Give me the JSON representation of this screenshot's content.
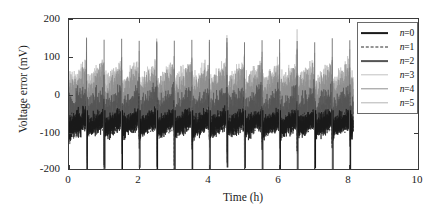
{
  "chart_data": {
    "type": "line",
    "title": "",
    "xlabel": "Time (h)",
    "ylabel": "Voltage error (mV)",
    "xlim": [
      0,
      10
    ],
    "ylim": [
      -200,
      200
    ],
    "xticks": [
      0,
      2,
      4,
      6,
      8,
      10
    ],
    "yticks": [
      200,
      100,
      0,
      -100,
      -200
    ],
    "grid": false,
    "legend_position": "upper right",
    "data_extent_hours": 8.1,
    "series": [
      {
        "name": "n=0",
        "label_prefix": "n",
        "label_value": "0",
        "color": "#1a1a1a",
        "dash": "solid",
        "band_low": -105,
        "band_high": -45,
        "spike_low": -200,
        "spike_high": 20,
        "description": "dark dense band near -75 mV with deep negative spikes to -200 mV"
      },
      {
        "name": "n=1",
        "label_prefix": "n",
        "label_value": "1",
        "color": "#2b2b2b",
        "dash": "dashed",
        "band_low": -100,
        "band_high": -50,
        "spike_low": -195,
        "spike_high": 15,
        "description": "dashed black trace overlapping the n=0 band"
      },
      {
        "name": "n=2",
        "label_prefix": "n",
        "label_value": "2",
        "color": "#555555",
        "dash": "solid",
        "band_low": -90,
        "band_high": 10,
        "spike_low": -180,
        "spike_high": 60,
        "description": "dark grey mid band"
      },
      {
        "name": "n=3",
        "label_prefix": "n",
        "label_value": "3",
        "color": "#c2c2c2",
        "dash": "solid",
        "band_low": -40,
        "band_high": 70,
        "spike_low": -150,
        "spike_high": 150,
        "description": "light grey broad band up to +70 mV with tall spikes to +150 mV"
      },
      {
        "name": "n=4",
        "label_prefix": "n",
        "label_value": "4",
        "color": "#8f8f8f",
        "dash": "solid",
        "band_low": -60,
        "band_high": 55,
        "spike_low": -165,
        "spike_high": 130,
        "description": "medium grey band"
      },
      {
        "name": "n=5",
        "label_prefix": "n",
        "label_value": "5",
        "color": "#b4b4b4",
        "dash": "solid",
        "band_low": -50,
        "band_high": 65,
        "spike_low": -160,
        "spike_high": 145,
        "description": "light grey band"
      }
    ],
    "spike_period_hours": 0.5,
    "spike_count": 16
  },
  "axes": {
    "x_tick_labels": [
      "0",
      "2",
      "4",
      "6",
      "8",
      "10"
    ],
    "y_tick_labels": [
      "200",
      "100",
      "0",
      "-100",
      "-200"
    ],
    "x_title": "Time (h)",
    "y_title": "Voltage error (mV)"
  },
  "legend": {
    "entries": [
      {
        "prefix": "n",
        "eq": "=",
        "value": "0",
        "text": "n=0"
      },
      {
        "prefix": "n",
        "eq": "=",
        "value": "1",
        "text": "n=1"
      },
      {
        "prefix": "n",
        "eq": "=",
        "value": "2",
        "text": "n=2"
      },
      {
        "prefix": "n",
        "eq": "=",
        "value": "3",
        "text": "n=3"
      },
      {
        "prefix": "n",
        "eq": "=",
        "value": "4",
        "text": "n=4"
      },
      {
        "prefix": "n",
        "eq": "=",
        "value": "5",
        "text": "n=5"
      }
    ]
  },
  "colors": {
    "axis": "#3a3a3a",
    "legend_border": "#6a6a6a",
    "background": "#ffffff",
    "text": "#1a1a1a"
  }
}
